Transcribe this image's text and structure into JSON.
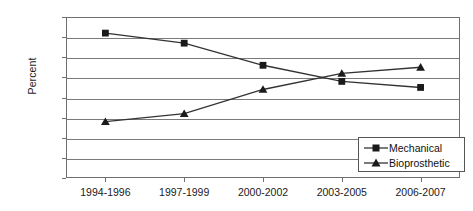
{
  "chart_data": {
    "type": "line",
    "title": "",
    "xlabel": "",
    "ylabel": "Percent",
    "categories": [
      "1994-1996",
      "1997-1999",
      "2000-2002",
      "2003-2005",
      "2006-2007"
    ],
    "series": [
      {
        "name": "Mechanical",
        "marker": "square",
        "values": [
          72,
          67,
          56,
          48,
          45
        ]
      },
      {
        "name": "Bioprosthetic",
        "marker": "triangle",
        "values": [
          28,
          32,
          44,
          52,
          55
        ]
      }
    ],
    "ylim": [
      0,
      80
    ],
    "ytick_step": 10,
    "ytick_labels": [
      "80%",
      "70%",
      "60%",
      "50%",
      "40%",
      "30%",
      "20%",
      "10%",
      "0%"
    ],
    "grid": true,
    "legend_position": "bottom-right",
    "colors": {
      "line": "#333333",
      "marker": "#1a1a1a",
      "grid": "#7a7a7a",
      "frame": "#6f6f6f",
      "background": "#ffffff"
    }
  },
  "legend": {
    "items": [
      {
        "label": "Mechanical",
        "marker": "square"
      },
      {
        "label": "Bioprosthetic",
        "marker": "triangle"
      }
    ]
  }
}
